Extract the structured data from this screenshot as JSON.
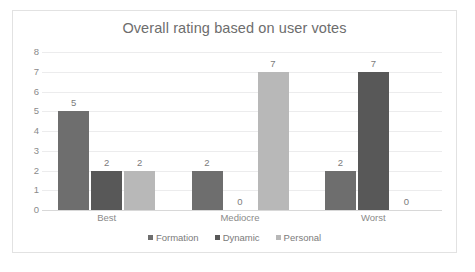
{
  "chart_data": {
    "type": "bar",
    "title": "Overall rating based on user votes",
    "xlabel": "",
    "ylabel": "",
    "categories": [
      "Best",
      "Mediocre",
      "Worst"
    ],
    "series": [
      {
        "name": "Formation",
        "values": [
          5,
          2,
          2
        ],
        "color": "#6e6e6e"
      },
      {
        "name": "Dynamic",
        "values": [
          2,
          0,
          7
        ],
        "color": "#585858"
      },
      {
        "name": "Personal",
        "values": [
          2,
          7,
          0
        ],
        "color": "#b8b8b8"
      }
    ],
    "ylim": [
      0,
      8
    ],
    "y_ticks": [
      0,
      1,
      2,
      3,
      4,
      5,
      6,
      7,
      8
    ],
    "grid": true,
    "legend_position": "bottom",
    "data_labels": true
  },
  "colors": {
    "frame_border": "#e2e2e2",
    "gridline": "#ececed",
    "axis_base": "#d8d8d8",
    "title_text": "#6d6d6d",
    "tick_text": "#8a8a8a",
    "label_text": "#7b7b7b",
    "background": "#ffffff"
  }
}
